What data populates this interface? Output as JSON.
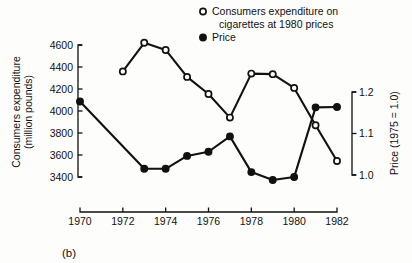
{
  "chart_data": {
    "type": "line",
    "title": "",
    "caption": "(b)",
    "xlabel": "",
    "x": [
      1970,
      1971,
      1972,
      1973,
      1974,
      1975,
      1976,
      1977,
      1978,
      1979,
      1980,
      1981,
      1982
    ],
    "xlim": [
      1969.4,
      1982.6
    ],
    "xticks": [
      1970,
      1972,
      1974,
      1976,
      1978,
      1980,
      1982
    ],
    "xtick_labels": [
      "1970",
      "1972",
      "1974",
      "1976",
      "1978",
      "1980",
      "1982"
    ],
    "grid": false,
    "legend_position": "top-right",
    "axes": [
      {
        "id": "left",
        "label": "Consumers expenditure",
        "label_line2": "(million pounds)",
        "ylim": [
          3400,
          4600
        ],
        "yticks": [
          3400,
          3600,
          3800,
          4000,
          4200,
          4400,
          4600
        ],
        "ytick_labels": [
          "3400",
          "3600",
          "3800",
          "4000",
          "4200",
          "4400",
          "4600"
        ]
      },
      {
        "id": "right",
        "label": "Price (1975 = 1.0)",
        "ylim": [
          1.0,
          1.2
        ],
        "yticks": [
          1.0,
          1.1,
          1.2
        ],
        "ytick_labels": [
          "1.0",
          "1.1",
          "1.2"
        ]
      }
    ],
    "series": [
      {
        "name": "Consumers expenditure on cigarettes at 1980 prices",
        "legend_label_line1": "Consumers expenditure on",
        "legend_label_line2": "cigarettes at 1980 prices",
        "axis": "left",
        "marker": "open-circle",
        "color": "#111111",
        "x": [
          1972,
          1973,
          1974,
          1975,
          1976,
          1977,
          1978,
          1979,
          1980,
          1981,
          1982
        ],
        "values": [
          4360,
          4620,
          4555,
          4310,
          4155,
          3940,
          4340,
          4335,
          4210,
          3870,
          3545
        ]
      },
      {
        "name": "Price",
        "legend_label_line1": "Price",
        "legend_label_line2": "",
        "axis": "right",
        "marker": "filled-circle",
        "color": "#111111",
        "x": [
          1970,
          1973,
          1974,
          1975,
          1976,
          1977,
          1978,
          1979,
          1980,
          1981,
          1982
        ],
        "values": [
          1.177,
          1.015,
          1.015,
          1.046,
          1.056,
          1.093,
          1.007,
          0.988,
          0.995,
          1.163,
          1.164
        ]
      }
    ]
  }
}
